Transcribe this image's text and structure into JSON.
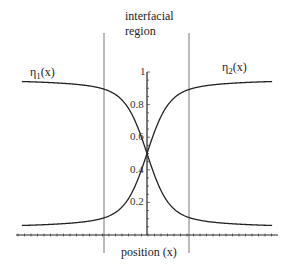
{
  "chart_data": {
    "type": "line",
    "title": "",
    "xlabel": "position (x)",
    "ylabel": "",
    "annotations": [
      {
        "text": "interfacial region",
        "position": "top-center, between two vertical boundary lines"
      }
    ],
    "ylim": [
      0,
      1
    ],
    "yticks": [
      0.2,
      0.4,
      0.6,
      0.8,
      1
    ],
    "ytick_labels": [
      "0.2",
      "0.4",
      "0.6",
      "0.8",
      "1"
    ],
    "xlim": [
      -4,
      4
    ],
    "interfacial_region_bounds": [
      -1.3,
      1.3
    ],
    "grid": false,
    "legend": "inline labels",
    "series": [
      {
        "name": "η1(x)",
        "label_main": "η",
        "label_sub": "1",
        "label_suffix": "(x)",
        "x": [
          -3.8,
          -3,
          -2,
          -1.3,
          -1,
          -0.5,
          -0.25,
          0,
          0.25,
          0.5,
          1,
          1.3,
          2,
          3,
          3.8
        ],
        "values": [
          0.965,
          0.955,
          0.94,
          0.915,
          0.89,
          0.79,
          0.68,
          0.5,
          0.32,
          0.21,
          0.11,
          0.085,
          0.06,
          0.045,
          0.035
        ]
      },
      {
        "name": "η2(x)",
        "label_main": "η",
        "label_sub": "2",
        "label_suffix": "(x)",
        "x": [
          -3.8,
          -3,
          -2,
          -1.3,
          -1,
          -0.5,
          -0.25,
          0,
          0.25,
          0.5,
          1,
          1.3,
          2,
          3,
          3.8
        ],
        "values": [
          0.035,
          0.045,
          0.06,
          0.085,
          0.11,
          0.21,
          0.32,
          0.5,
          0.68,
          0.79,
          0.89,
          0.915,
          0.94,
          0.955,
          0.965
        ]
      }
    ]
  },
  "labels": {
    "region_line1": "interfacial",
    "region_line2": "region",
    "eta1_main": "η",
    "eta1_sub": "1",
    "eta1_suffix": "(x)",
    "eta2_main": "η",
    "eta2_sub": "2",
    "eta2_suffix": "(x)",
    "xlabel": "position (x)"
  }
}
